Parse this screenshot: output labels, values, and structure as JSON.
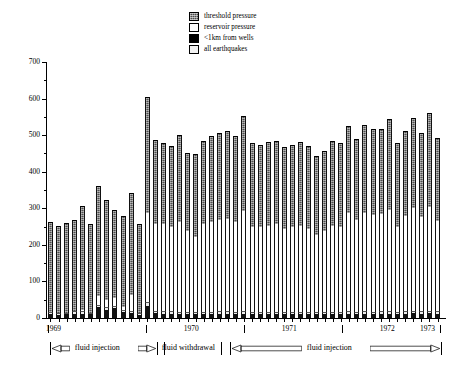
{
  "chart_data": {
    "type": "bar",
    "stacked": true,
    "title": "",
    "xlabel": "",
    "ylabel": "Number of earthquakes",
    "ylim": [
      0,
      700
    ],
    "ytick_step": 100,
    "ytick_labels": [
      "0",
      "100",
      "200",
      "300",
      "400",
      "500",
      "600",
      "700"
    ],
    "grid": false,
    "legend_position": "top-center",
    "x_year_labels": [
      "1969",
      "1970",
      "1971",
      "1972",
      "1973"
    ],
    "series": [
      {
        "name": "all earthquakes",
        "color": "#ededed"
      },
      {
        "name": "<1km from wells",
        "color": "#111111"
      },
      {
        "name": "reservoir pressure",
        "color": "#ffffff"
      },
      {
        "name": "threshold pressure",
        "color": "#4e4e4e"
      }
    ],
    "n_bars": 49,
    "bars": [
      {
        "total": 262,
        "reservoir": 0,
        "wells": 10,
        "all": 16
      },
      {
        "total": 252,
        "reservoir": 0,
        "wells": 8,
        "all": 14
      },
      {
        "total": 260,
        "reservoir": 0,
        "wells": 10,
        "all": 15
      },
      {
        "total": 268,
        "reservoir": 0,
        "wells": 12,
        "all": 18
      },
      {
        "total": 306,
        "reservoir": 22,
        "wells": 12,
        "all": 18
      },
      {
        "total": 256,
        "reservoir": 0,
        "wells": 10,
        "all": 14
      },
      {
        "total": 360,
        "reservoir": 60,
        "wells": 30,
        "all": 36
      },
      {
        "total": 322,
        "reservoir": 48,
        "wells": 22,
        "all": 30
      },
      {
        "total": 296,
        "reservoir": 54,
        "wells": 28,
        "all": 34
      },
      {
        "total": 280,
        "reservoir": 30,
        "wells": 16,
        "all": 22
      },
      {
        "total": 342,
        "reservoir": 62,
        "wells": 14,
        "all": 20
      },
      {
        "total": 258,
        "reservoir": 0,
        "wells": 8,
        "all": 14
      },
      {
        "total": 605,
        "reservoir": 288,
        "wells": 34,
        "all": 44
      },
      {
        "total": 488,
        "reservoir": 258,
        "wells": 14,
        "all": 20
      },
      {
        "total": 478,
        "reservoir": 258,
        "wells": 12,
        "all": 18
      },
      {
        "total": 470,
        "reservoir": 248,
        "wells": 12,
        "all": 18
      },
      {
        "total": 500,
        "reservoir": 262,
        "wells": 10,
        "all": 16
      },
      {
        "total": 452,
        "reservoir": 238,
        "wells": 10,
        "all": 16
      },
      {
        "total": 448,
        "reservoir": 222,
        "wells": 10,
        "all": 16
      },
      {
        "total": 484,
        "reservoir": 258,
        "wells": 10,
        "all": 16
      },
      {
        "total": 498,
        "reservoir": 262,
        "wells": 10,
        "all": 16
      },
      {
        "total": 506,
        "reservoir": 268,
        "wells": 12,
        "all": 18
      },
      {
        "total": 512,
        "reservoir": 272,
        "wells": 12,
        "all": 18
      },
      {
        "total": 498,
        "reservoir": 262,
        "wells": 10,
        "all": 16
      },
      {
        "total": 552,
        "reservoir": 292,
        "wells": 12,
        "all": 18
      },
      {
        "total": 478,
        "reservoir": 250,
        "wells": 10,
        "all": 16
      },
      {
        "total": 472,
        "reservoir": 248,
        "wells": 10,
        "all": 16
      },
      {
        "total": 480,
        "reservoir": 252,
        "wells": 10,
        "all": 16
      },
      {
        "total": 484,
        "reservoir": 256,
        "wells": 10,
        "all": 16
      },
      {
        "total": 468,
        "reservoir": 244,
        "wells": 10,
        "all": 16
      },
      {
        "total": 472,
        "reservoir": 248,
        "wells": 10,
        "all": 16
      },
      {
        "total": 482,
        "reservoir": 252,
        "wells": 10,
        "all": 16
      },
      {
        "total": 470,
        "reservoir": 244,
        "wells": 10,
        "all": 16
      },
      {
        "total": 442,
        "reservoir": 228,
        "wells": 10,
        "all": 16
      },
      {
        "total": 458,
        "reservoir": 238,
        "wells": 10,
        "all": 16
      },
      {
        "total": 484,
        "reservoir": 252,
        "wells": 10,
        "all": 16
      },
      {
        "total": 478,
        "reservoir": 248,
        "wells": 10,
        "all": 16
      },
      {
        "total": 524,
        "reservoir": 288,
        "wells": 12,
        "all": 18
      },
      {
        "total": 490,
        "reservoir": 268,
        "wells": 10,
        "all": 16
      },
      {
        "total": 528,
        "reservoir": 286,
        "wells": 12,
        "all": 18
      },
      {
        "total": 516,
        "reservoir": 282,
        "wells": 10,
        "all": 16
      },
      {
        "total": 518,
        "reservoir": 284,
        "wells": 12,
        "all": 18
      },
      {
        "total": 544,
        "reservoir": 296,
        "wells": 12,
        "all": 18
      },
      {
        "total": 478,
        "reservoir": 250,
        "wells": 10,
        "all": 16
      },
      {
        "total": 512,
        "reservoir": 280,
        "wells": 12,
        "all": 18
      },
      {
        "total": 548,
        "reservoir": 300,
        "wells": 14,
        "all": 20
      },
      {
        "total": 506,
        "reservoir": 276,
        "wells": 12,
        "all": 18
      },
      {
        "total": 560,
        "reservoir": 304,
        "wells": 14,
        "all": 20
      },
      {
        "total": 492,
        "reservoir": 264,
        "wells": 12,
        "all": 18
      }
    ]
  },
  "legend": {
    "items": [
      {
        "label": "threshold pressure",
        "swatch": "threshold"
      },
      {
        "label": "reservoir pressure",
        "swatch": "reservoir"
      },
      {
        "label": "<1km from wells",
        "swatch": "wells"
      },
      {
        "label": "all earthquakes",
        "swatch": "all"
      }
    ]
  },
  "axes": {
    "y_title": "Number of earthquakes",
    "y_labels": [
      "700",
      "600",
      "500",
      "400",
      "300",
      "200",
      "100",
      "0"
    ],
    "x_labels": [
      "1969",
      "1970",
      "1971",
      "1972",
      "1973"
    ]
  },
  "periods": [
    {
      "label": "fluid injection",
      "start_pct": 1.0,
      "end_pct": 28.0
    },
    {
      "label": "fluid withdrawal",
      "start_pct": 29.5,
      "end_pct": 44.0
    },
    {
      "label": "fluid injection",
      "start_pct": 46.0,
      "end_pct": 99.0
    }
  ]
}
